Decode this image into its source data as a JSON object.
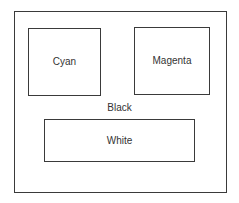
{
  "diagram": {
    "regions": [
      {
        "id": "cyan",
        "label": "Cyan"
      },
      {
        "id": "magenta",
        "label": "Magenta"
      },
      {
        "id": "white",
        "label": "White"
      }
    ],
    "background_label": "Black"
  }
}
